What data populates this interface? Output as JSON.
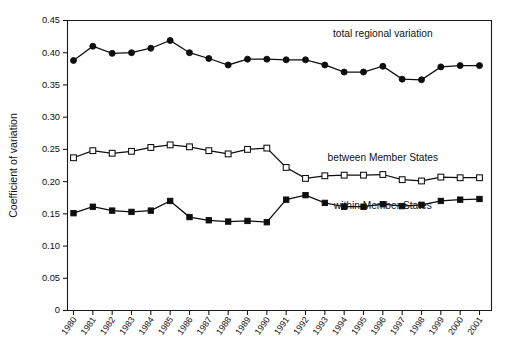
{
  "chart_data": {
    "type": "line",
    "title": "",
    "xlabel": "",
    "ylabel": "Coefficient of variation",
    "ylim": [
      0,
      0.45
    ],
    "ytick_labels": [
      "0",
      "0.05",
      "0.10",
      "0.15",
      "0.20",
      "0.25",
      "0.30",
      "0.35",
      "0.40",
      "0.45"
    ],
    "ytick_values": [
      0,
      0.05,
      0.1,
      0.15,
      0.2,
      0.25,
      0.3,
      0.35,
      0.4,
      0.45
    ],
    "grid": false,
    "legend_position": "inline-right",
    "categories": [
      "1980",
      "1981",
      "1982",
      "1983",
      "1984",
      "1985",
      "1986",
      "1987",
      "1988",
      "1989",
      "1990",
      "1991",
      "1992",
      "1993",
      "1994",
      "1995",
      "1996",
      "1997",
      "1998",
      "1999",
      "2000",
      "2001"
    ],
    "series": [
      {
        "name": "total regional variation",
        "marker": "filled-circle",
        "label_x_category": "1996",
        "label_y_value": 0.425,
        "values": [
          0.388,
          0.41,
          0.399,
          0.4,
          0.407,
          0.419,
          0.4,
          0.391,
          0.381,
          0.39,
          0.39,
          0.389,
          0.389,
          0.381,
          0.37,
          0.37,
          0.379,
          0.359,
          0.358,
          0.378,
          0.38,
          0.38
        ]
      },
      {
        "name": "between Member States",
        "marker": "open-square",
        "label_x_category": "1996",
        "label_y_value": 0.232,
        "values": [
          0.237,
          0.248,
          0.244,
          0.247,
          0.253,
          0.257,
          0.254,
          0.248,
          0.243,
          0.25,
          0.252,
          0.222,
          0.205,
          0.209,
          0.21,
          0.21,
          0.211,
          0.203,
          0.201,
          0.207,
          0.206,
          0.206
        ]
      },
      {
        "name": "within Member States",
        "marker": "filled-square",
        "label_x_category": "1996",
        "label_y_value": 0.158,
        "values": [
          0.151,
          0.161,
          0.155,
          0.153,
          0.155,
          0.17,
          0.145,
          0.14,
          0.138,
          0.139,
          0.137,
          0.172,
          0.179,
          0.167,
          0.161,
          0.161,
          0.165,
          0.162,
          0.164,
          0.17,
          0.172,
          0.173
        ]
      }
    ]
  }
}
